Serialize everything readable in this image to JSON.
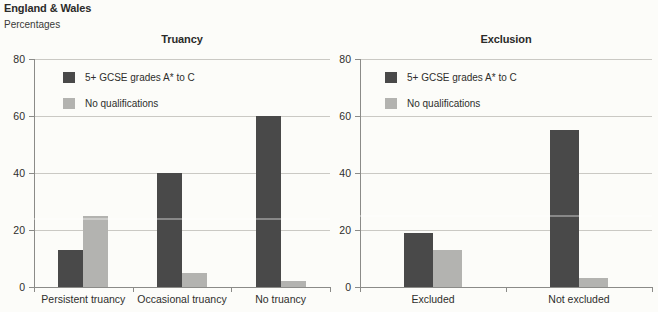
{
  "header": {
    "region": "England & Wales",
    "unit": "Percentages"
  },
  "colors": {
    "series1_dark": "#494949",
    "series2_light": "#b3b3b0",
    "gridline": "#cac9c4",
    "axis": "#8b8b88",
    "text": "#2b2b29",
    "background": "#fcfcf9"
  },
  "chart_data": [
    {
      "type": "bar",
      "title": "Truancy",
      "categories": [
        "Persistent truancy",
        "Occasional truancy",
        "No truancy"
      ],
      "series": [
        {
          "name": "5+ GCSE grades A* to C",
          "values": [
            13,
            40,
            60
          ]
        },
        {
          "name": "No qualifications",
          "values": [
            25,
            5,
            2
          ]
        }
      ],
      "xlabel": "",
      "ylabel": "Percentages",
      "ylim": [
        0,
        80
      ],
      "yticks": [
        0,
        20,
        40,
        60,
        80
      ],
      "grid": "horizontal",
      "legend_position": "top-left-inside"
    },
    {
      "type": "bar",
      "title": "Exclusion",
      "categories": [
        "Excluded",
        "Not excluded"
      ],
      "series": [
        {
          "name": "5+ GCSE grades A* to C",
          "values": [
            19,
            55
          ]
        },
        {
          "name": "No qualifications",
          "values": [
            13,
            3
          ]
        }
      ],
      "xlabel": "",
      "ylabel": "Percentages",
      "ylim": [
        0,
        80
      ],
      "yticks": [
        0,
        20,
        40,
        60,
        80
      ],
      "grid": "horizontal",
      "legend_position": "top-left-inside"
    }
  ]
}
